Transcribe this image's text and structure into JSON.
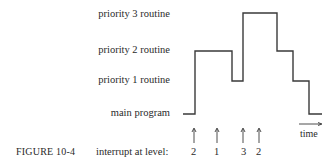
{
  "figure": {
    "caption": "FIGURE 10-4",
    "levels": [
      {
        "name": "priority 3 routine",
        "level": 3
      },
      {
        "name": "priority 2 routine",
        "level": 2
      },
      {
        "name": "priority 1 routine",
        "level": 1
      },
      {
        "name": "main program",
        "level": 0
      }
    ],
    "interrupt_label": "interrupt at level:",
    "interrupts": [
      "2",
      "1",
      "3",
      "2"
    ],
    "time_label": "time",
    "execution_trace": [
      0,
      2,
      1,
      3,
      2,
      1,
      0
    ],
    "line_color": "#3a3a3a"
  }
}
